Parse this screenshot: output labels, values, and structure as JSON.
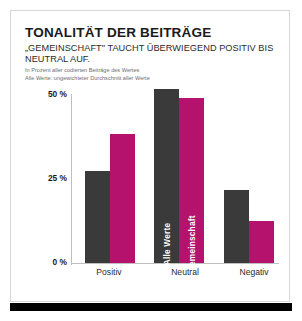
{
  "card": {
    "title": "TONALITÄT DER BEITRÄGE",
    "subtitle": "„GEMEINSCHAFT\" TAUCHT ÜBERWIEGEND POSITIV BIS NEUTRAL AUF.",
    "note1": "In Prozent aller codierten Beiträge des Wertes",
    "note2": "Alle Werte: ungewichteter Durchschnitt aller Werte"
  },
  "colors": {
    "series_alle_werte": "#3a3a3a",
    "series_gemeinschaft": "#b5126e",
    "axis": "#bfbfbf",
    "frame": "#d8d8d8",
    "footer_bar": "#000000"
  },
  "axis": {
    "ticks": [
      "50 %",
      "25 %",
      "0 %"
    ],
    "tick_values": [
      50,
      25,
      0
    ]
  },
  "inbar_labels": {
    "alle_werte": "Alle Werte",
    "gemeinschaft": "Gemeinschaft"
  },
  "chart_data": {
    "type": "bar",
    "title": "TONALITÄT DER BEITRÄGE",
    "subtitle": "„GEMEINSCHAFT\" TAUCHT ÜBERWIEGEND POSITIV BIS NEUTRAL AUF.",
    "xlabel": "",
    "ylabel": "",
    "ylim": [
      0,
      50
    ],
    "yticks": [
      0,
      25,
      50
    ],
    "ytick_labels": [
      "0 %",
      "25 %",
      "50 %"
    ],
    "grid": false,
    "legend": "in-bar",
    "categories": [
      "Positiv",
      "Neutral",
      "Negativ"
    ],
    "series": [
      {
        "name": "Alle Werte",
        "color": "#3a3a3a",
        "values": [
          27.5,
          52,
          22
        ]
      },
      {
        "name": "Gemeinschaft",
        "color": "#b5126e",
        "values": [
          38.5,
          49.5,
          12.5
        ]
      }
    ],
    "annotations": [
      "In Prozent aller codierten Beiträge des Wertes",
      "Alle Werte: ungewichteter Durchschnitt aller Werte"
    ]
  }
}
